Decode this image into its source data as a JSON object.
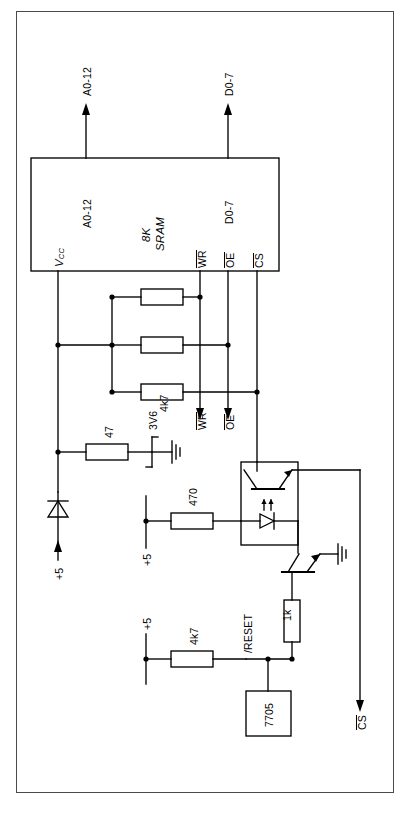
{
  "diagram": {
    "orientation": "rotated-90",
    "page_border_color": "#4a4a4a",
    "line_color": "#000000"
  },
  "ic_sram": {
    "name": "8K SRAM",
    "name_line1": "8K",
    "name_line2": "SRAM",
    "pins": {
      "vcc": "V",
      "vcc_sub": "CC",
      "addr": "A0-12",
      "data": "D0-7",
      "wr": "WR",
      "oe": "OE",
      "cs": "CS"
    }
  },
  "bus_labels": {
    "addr_external": "A0-12",
    "data_external": "D0-7",
    "wr_external": "WR",
    "oe_external": "OE",
    "cs_external": "CS"
  },
  "components": [
    {
      "ref": "pullup-1",
      "value": "4k7",
      "type": "resistor"
    },
    {
      "ref": "pullup-2",
      "value": "4k7",
      "type": "resistor"
    },
    {
      "ref": "pullup-3",
      "value": "4k7",
      "type": "resistor"
    },
    {
      "ref": "series-r",
      "value": "47",
      "type": "resistor"
    },
    {
      "ref": "zener",
      "value": "3V6",
      "type": "zener-diode"
    },
    {
      "ref": "led-r",
      "value": "470",
      "type": "resistor"
    },
    {
      "ref": "base-r",
      "value": "1k",
      "type": "resistor"
    },
    {
      "ref": "reset-pullup",
      "value": "4k7",
      "type": "resistor"
    },
    {
      "ref": "supervisor",
      "value": "7705",
      "type": "ic"
    },
    {
      "ref": "opto",
      "value": "",
      "type": "optocoupler"
    },
    {
      "ref": "npn",
      "value": "",
      "type": "npn-transistor"
    },
    {
      "ref": "backup-diode",
      "value": "",
      "type": "diode"
    }
  ],
  "resistor_values": {
    "pullup_1": "4k7",
    "pullup_2": "4k7",
    "pullup_3": "4k7",
    "series_47": "47",
    "led_470": "470",
    "base_1k": "1k",
    "reset_4k7": "4k7"
  },
  "nets": {
    "supply_1": "+5",
    "supply_2": "+5",
    "supply_3": "+5",
    "zener_value": "3V6",
    "reset_label": "/RESET",
    "supervisor_label": "7705"
  }
}
